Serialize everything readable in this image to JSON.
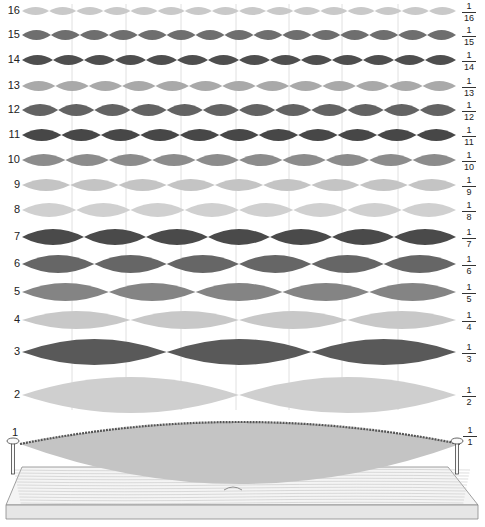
{
  "diagram": {
    "x_start": 22,
    "x_end": 456,
    "node_lines_x": [
      72,
      126,
      181,
      236,
      289,
      342,
      398
    ],
    "node_line_color": "#d8d8d8",
    "rows": [
      {
        "n": 16,
        "label": "16",
        "fraction": {
          "num": "1",
          "den": "16"
        },
        "y": 11,
        "half_height": 4,
        "color": "#c9c9c9"
      },
      {
        "n": 15,
        "label": "15",
        "fraction": {
          "num": "1",
          "den": "15"
        },
        "y": 35,
        "half_height": 5,
        "color": "#6e6e6e"
      },
      {
        "n": 14,
        "label": "14",
        "fraction": {
          "num": "1",
          "den": "14"
        },
        "y": 60,
        "half_height": 5,
        "color": "#4e4e4e"
      },
      {
        "n": 13,
        "label": "13",
        "fraction": {
          "num": "1",
          "den": "13"
        },
        "y": 86,
        "half_height": 5,
        "color": "#a9a9a9"
      },
      {
        "n": 12,
        "label": "12",
        "fraction": {
          "num": "1",
          "den": "12"
        },
        "y": 110,
        "half_height": 6,
        "color": "#636363"
      },
      {
        "n": 11,
        "label": "11",
        "fraction": {
          "num": "1",
          "den": "11"
        },
        "y": 135,
        "half_height": 6,
        "color": "#474747"
      },
      {
        "n": 10,
        "label": "10",
        "fraction": {
          "num": "1",
          "den": "10"
        },
        "y": 160,
        "half_height": 6,
        "color": "#8c8c8c"
      },
      {
        "n": 9,
        "label": "9",
        "fraction": {
          "num": "1",
          "den": "9"
        },
        "y": 185,
        "half_height": 6,
        "color": "#c4c4c4"
      },
      {
        "n": 8,
        "label": "8",
        "fraction": {
          "num": "1",
          "den": "8"
        },
        "y": 210,
        "half_height": 7,
        "color": "#d0d0d0"
      },
      {
        "n": 7,
        "label": "7",
        "fraction": {
          "num": "1",
          "den": "7"
        },
        "y": 237,
        "half_height": 8,
        "color": "#4a4a4a"
      },
      {
        "n": 6,
        "label": "6",
        "fraction": {
          "num": "1",
          "den": "6"
        },
        "y": 264,
        "half_height": 9,
        "color": "#666666"
      },
      {
        "n": 5,
        "label": "5",
        "fraction": {
          "num": "1",
          "den": "5"
        },
        "y": 292,
        "half_height": 9,
        "color": "#848484"
      },
      {
        "n": 4,
        "label": "4",
        "fraction": {
          "num": "1",
          "den": "4"
        },
        "y": 320,
        "half_height": 9,
        "color": "#c8c8c8"
      },
      {
        "n": 3,
        "label": "3",
        "fraction": {
          "num": "1",
          "den": "3"
        },
        "y": 352,
        "half_height": 13,
        "color": "#595959"
      },
      {
        "n": 2,
        "label": "2",
        "fraction": {
          "num": "1",
          "den": "2"
        },
        "y": 395,
        "half_height": 18,
        "color": "#cfcfcf"
      }
    ],
    "fundamental": {
      "n": 1,
      "label": "1",
      "fraction": {
        "num": "1",
        "den": "1"
      },
      "y": 444,
      "half_height": 40,
      "color": "#c4c4c4",
      "string_color": "#555555"
    },
    "board": {
      "top_color": "#f4f4f4",
      "front_color": "#e6e6e6",
      "grain_color": "#bdbdbd"
    }
  }
}
